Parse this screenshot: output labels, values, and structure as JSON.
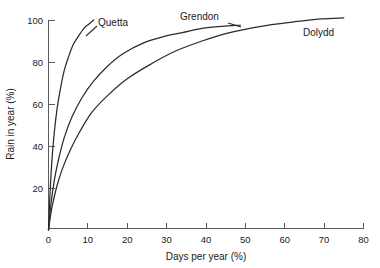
{
  "chart_data": {
    "type": "line",
    "title": "",
    "xlabel": "Days per year (%)",
    "ylabel": "Rain in year (%)",
    "xlim": [
      0,
      80
    ],
    "ylim": [
      0,
      105
    ],
    "xticks": [
      0,
      10,
      20,
      30,
      40,
      50,
      60,
      70,
      80
    ],
    "xtick_labels": [
      "0",
      "10",
      "20",
      "30",
      "40",
      "50",
      "60",
      "70",
      "80"
    ],
    "yticks": [
      20,
      40,
      60,
      80,
      100
    ],
    "ytick_labels": [
      "20",
      "40",
      "60",
      "80",
      "100"
    ],
    "grid": false,
    "legend": "inline-curve-labels",
    "line_color": "#2b2b2b",
    "axis_color": "#5a5a5a",
    "background": "#ffffff",
    "series": [
      {
        "name": "Quetta",
        "label": "Quetta",
        "x": [
          0,
          0.4,
          0.9,
          1.5,
          2.2,
          3.0,
          4.0,
          5.0,
          6.2,
          7.5,
          9.0,
          10.2,
          11.5
        ],
        "values": [
          0,
          18,
          34,
          47,
          58,
          67,
          76,
          82,
          88,
          92,
          96,
          98,
          100
        ]
      },
      {
        "name": "Grendon",
        "label": "Grendon",
        "x": [
          0,
          0.6,
          1.5,
          2.6,
          4.0,
          6.0,
          8.5,
          11.5,
          15.0,
          19.0,
          24.0,
          29.0,
          34.0,
          39.0,
          44.0,
          48.7
        ],
        "values": [
          0,
          12,
          24,
          34,
          44,
          54,
          63,
          71,
          78,
          84,
          89,
          92,
          94,
          96,
          97,
          97.5
        ]
      },
      {
        "name": "Dolydd",
        "label": "Dolydd",
        "x": [
          0,
          0.8,
          2.0,
          3.5,
          5.5,
          8.0,
          11.0,
          15.0,
          20.0,
          26.0,
          32.0,
          39.0,
          46.0,
          54.0,
          62.0,
          69.0,
          75.0
        ],
        "values": [
          0,
          10,
          20,
          29,
          38,
          47,
          56,
          64,
          72,
          79,
          85,
          90,
          94,
          97,
          99,
          100.5,
          101
        ]
      }
    ],
    "series_labels": [
      {
        "name": "Quetta",
        "text": "Quetta",
        "x_px": 98,
        "y_px": 26
      },
      {
        "name": "Grendon",
        "text": "Grendon",
        "x_px": 180,
        "y_px": 20
      },
      {
        "name": "Dolydd",
        "text": "Dolydd",
        "x_px": 303,
        "y_px": 36
      }
    ]
  }
}
